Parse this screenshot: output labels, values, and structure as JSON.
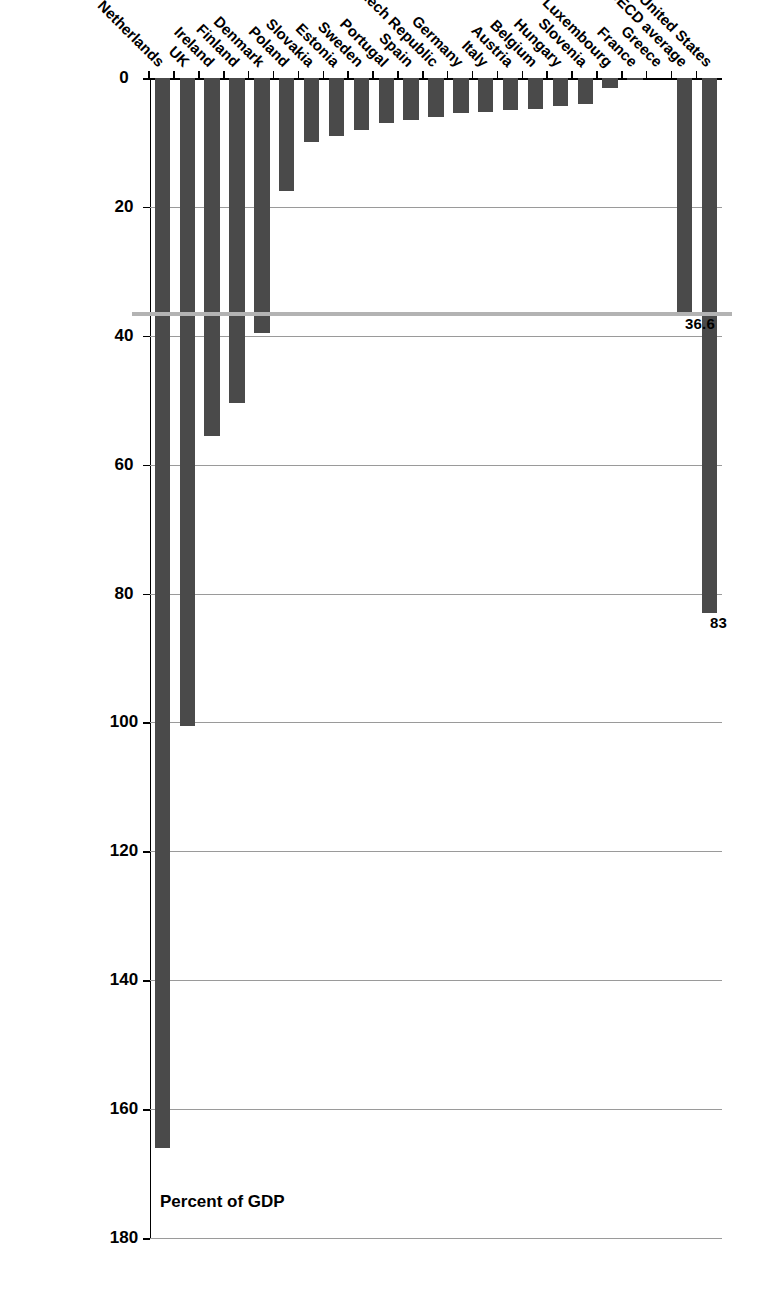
{
  "chart_data": {
    "type": "bar",
    "orientation": "horizontal-rotated",
    "title": "",
    "subtitle": "",
    "xlabel": "",
    "ylabel": "Percent of GDP",
    "value_axis_title": "Percent of GDP",
    "ylim": [
      0,
      180
    ],
    "axis_ticks": [
      0,
      20,
      40,
      60,
      80,
      100,
      120,
      140,
      160,
      180
    ],
    "grid": true,
    "grid_axis": "value",
    "legend": null,
    "legend_position": "none",
    "bar_color": "#4a4a4a",
    "gridline_color": "#9a9a9a",
    "reference_line": {
      "label": "36.6",
      "value": 36.6,
      "color": "#b3b3b3"
    },
    "annotations": [
      {
        "category": "United States",
        "text": "83"
      },
      {
        "category": "OECD average",
        "text": "36.6"
      }
    ],
    "categories": [
      "Netherlands",
      "UK",
      "Ireland",
      "Finland",
      "Denmark",
      "Poland",
      "Slovakia",
      "Estonia",
      "Sweden",
      "Portugal",
      "Spain",
      "Czech Republic",
      "Germany",
      "Italy",
      "Austria",
      "Belgium",
      "Hungary",
      "Slovenia",
      "Luxembourg",
      "France",
      "Greece",
      "OECD average",
      "United States"
    ],
    "values": [
      166,
      100.6,
      55.5,
      50.5,
      39.5,
      17.5,
      10,
      9,
      8,
      7,
      6.5,
      6,
      5.5,
      5.3,
      5,
      4.8,
      4.3,
      4,
      1.5,
      0.3,
      0,
      36.6,
      83
    ]
  }
}
